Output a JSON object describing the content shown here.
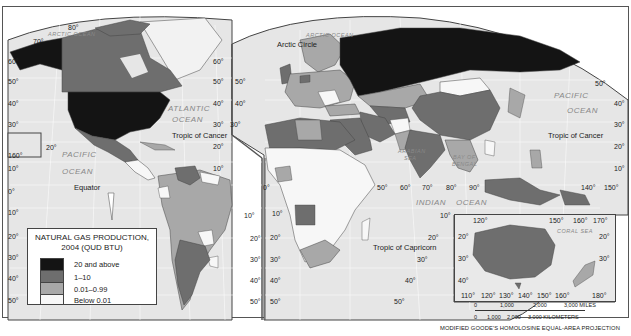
{
  "map": {
    "title": "Natural Gas Production, 2004",
    "projection_label": "MODIFIED GOODE'S HOMOLOSINE EQUAL-AREA PROJECTION",
    "colors": {
      "ocean": "#e6e6e6",
      "class_20_above": "#141414",
      "class_1_10": "#6e6e6e",
      "class_0_01_0_99": "#a8a8a8",
      "class_below_0_01": "#f7f7f7",
      "border": "#444444"
    }
  },
  "legend": {
    "title_line1": "NATURAL GAS PRODUCTION,",
    "title_line2": "2004 (QUD BTU)",
    "items": [
      {
        "label": "20 and above",
        "color": "#141414"
      },
      {
        "label": "1–10",
        "color": "#6e6e6e"
      },
      {
        "label": "0.01–0.99",
        "color": "#a8a8a8"
      },
      {
        "label": "Below 0.01",
        "color": "#f7f7f7"
      }
    ]
  },
  "oceans": {
    "arctic_west": "ARCTIC OCEAN",
    "arctic_east": "ARCTIC OCEAN",
    "atlantic_1": "ATLANTIC",
    "atlantic_2": "OCEAN",
    "pacific_west_1": "PACIFIC",
    "pacific_west_2": "OCEAN",
    "pacific_east_1": "PACIFIC",
    "pacific_east_2": "OCEAN",
    "indian_1": "INDIAN",
    "indian_2": "OCEAN",
    "arabian_sea_1": "ARABIAN",
    "arabian_sea_2": "SEA",
    "bay_of_bengal_1": "BAY OF",
    "bay_of_bengal_2": "BENGAL",
    "coral_sea": "CORAL SEA"
  },
  "lines": {
    "arctic_circle": "Arctic Circle",
    "tropic_cancer_west": "Tropic of Cancer",
    "tropic_cancer_east": "Tropic of Cancer",
    "equator": "Equator",
    "tropic_capricorn": "Tropic of Capricorn"
  },
  "degrees": {
    "nw_80": "80°",
    "nw_70": "70°",
    "w_60": "60°",
    "w_50": "50°",
    "w_40": "40°",
    "w_30": "30°",
    "w_20": "20°",
    "w_160": "160°",
    "w_10": "10°",
    "w_0": "0°",
    "w_s10": "10°",
    "w_s20": "20°",
    "w_s30": "30°",
    "w_s40": "40°",
    "w_s50": "50°",
    "am_r60": "60°",
    "am_r50": "50°",
    "am_r40": "40°",
    "am_r30": "30°",
    "am_r20": "20°",
    "am_r10": "10°",
    "am_rs10": "10°",
    "am_rs20": "20°",
    "am_rs30": "30°",
    "am_rs40": "40°",
    "am_rs50": "50°",
    "eu_50": "50°",
    "eu_40": "40°",
    "eu_30": "30°",
    "af_0": "0°",
    "af_s10": "10°",
    "af_s20": "20°",
    "af_s30": "30°",
    "af_s40": "40°",
    "af_s50": "50°",
    "lon_50": "50°",
    "lon_60": "60°",
    "lon_70": "70°",
    "lon_80": "80°",
    "lon_90": "90°",
    "lon_140": "140°",
    "lon_150": "150°",
    "ea_s10": "10°",
    "ea_s20": "20°",
    "ea_s30": "30°",
    "ea_s40": "40°",
    "ea_s50": "50°",
    "pac_50": "50°",
    "pac_40": "40°",
    "pac_30": "30°",
    "pac_20": "20°",
    "pac_10": "10°",
    "ind_s10": "10°"
  },
  "inset": {
    "top": [
      "120°",
      "150°",
      "160°",
      "170°"
    ],
    "left": [
      "20°",
      "30°",
      "40°"
    ],
    "right": [
      "20°",
      "30°"
    ],
    "bottom": [
      "110°",
      "120°",
      "130°",
      "140°",
      "150°",
      "160°",
      "180°"
    ]
  },
  "scale": {
    "miles": [
      "0",
      "1,000",
      "2,000",
      "3,000 MILES"
    ],
    "km": [
      "0",
      "1,000",
      "2,000",
      "3,000 KILOMETERS"
    ]
  }
}
